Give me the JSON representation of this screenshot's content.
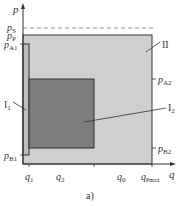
{
  "figure": {
    "caption": "a)",
    "colors": {
      "background": "#ffffff",
      "region_II_fill": "#cfcfcf",
      "region_I2_fill": "#7d7d7d",
      "region_I1_fill": "#bdbdbd",
      "line": "#333333",
      "dashed": "#777777"
    }
  },
  "axes": {
    "y_axis": {
      "symbol": "p"
    },
    "x_axis": {
      "symbol": "q"
    }
  },
  "y_labels": {
    "pS": {
      "main": "p",
      "sub": "S"
    },
    "pP": {
      "main": "p",
      "sub": "P"
    },
    "pA1": {
      "main": "p",
      "sub": "A1"
    },
    "pB1": {
      "main": "p",
      "sub": "B1"
    },
    "pA2": {
      "main": "p",
      "sub": "A2"
    },
    "pB2": {
      "main": "p",
      "sub": "B2"
    }
  },
  "x_labels": {
    "q1": {
      "main": "q",
      "sub": "1"
    },
    "q2": {
      "main": "q",
      "sub": "2"
    },
    "q0": {
      "main": "q",
      "sub": "0"
    },
    "qPmax": {
      "main": "q",
      "sub": "Pmax"
    }
  },
  "regions": {
    "II": {
      "label": "II"
    },
    "I1": {
      "label": "I",
      "sub": "1"
    },
    "I2": {
      "label": "I",
      "sub": "2"
    }
  }
}
